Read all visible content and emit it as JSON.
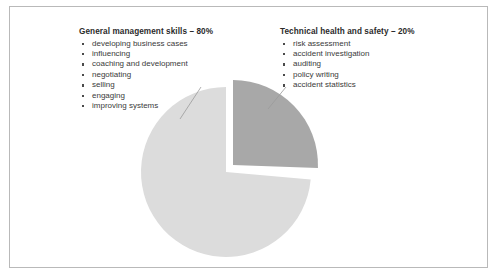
{
  "slide": {
    "background_color": "#ffffff",
    "border_color": "#b9b9b9"
  },
  "legend_left": {
    "title": "General management skills – 80%",
    "items": [
      "developing business cases",
      "influencing",
      "coaching and development",
      "negotiating",
      "selling",
      "engaging",
      "improving systems"
    ]
  },
  "legend_right": {
    "title": "Technical health and safety – 20%",
    "items": [
      "risk assessment",
      "accident investigation",
      "auditing",
      "policy writing",
      "accident statistics"
    ]
  },
  "chart_data": {
    "type": "pie",
    "title": "",
    "labels": [
      "General management skills",
      "Technical health and safety"
    ],
    "values": [
      80,
      20
    ],
    "value_suffix": "%",
    "colors": [
      "#dcdcdc",
      "#a8a8a8"
    ],
    "exploded": [
      false,
      true
    ],
    "legend_position": "top",
    "geometry": {
      "center_x": 226,
      "center_y": 172,
      "radius": 85,
      "major_start_angle_deg": 95,
      "major_end_angle_deg": 360,
      "minor_start_angle_deg": 0,
      "minor_end_angle_deg": 92,
      "explode_offset_x": 7,
      "explode_offset_y": -7
    },
    "leader_lines": [
      {
        "from_x": 201,
        "from_y": 87,
        "to_x": 180,
        "to_y": 119,
        "target": "General management skills"
      },
      {
        "from_x": 286,
        "from_y": 87,
        "to_x": 268,
        "to_y": 109,
        "target": "Technical health and safety"
      }
    ],
    "leader_color": "#9a9a9a"
  }
}
